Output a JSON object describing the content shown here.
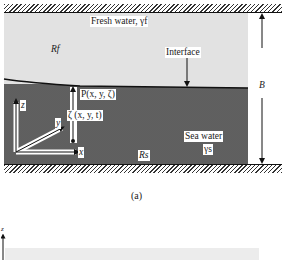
{
  "figure_a": {
    "caption": "(a)",
    "labels": {
      "fresh_water": "Fresh water, γf",
      "fresh_region": "Rf",
      "interface": "Interface",
      "point_p": "P(x, y, ζ)",
      "zeta": "ζ (x, y, t)",
      "sea_water": "Sea water",
      "sea_gamma": "γs",
      "sea_region": "Rs",
      "thickness": "B",
      "axis_x": "x",
      "axis_y": "y",
      "axis_z": "z"
    },
    "colors": {
      "fresh_fill": "#e2e2e2",
      "sea_fill": "#a8a8a8",
      "line": "#1a1a1a"
    }
  },
  "figure_b": {
    "labels": {
      "axis_z": "z"
    }
  }
}
